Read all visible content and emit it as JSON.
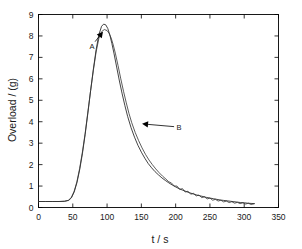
{
  "chart_data": {
    "type": "line",
    "title": "",
    "xlabel": "t / s",
    "ylabel": "Overload / (g)",
    "xlim": [
      0,
      350
    ],
    "ylim": [
      0,
      9
    ],
    "xticks": [
      0,
      50,
      100,
      150,
      200,
      250,
      300,
      350
    ],
    "yticks": [
      0,
      1,
      2,
      3,
      4,
      5,
      6,
      7,
      8,
      9
    ],
    "grid": false,
    "legend": "none",
    "annotations": [
      {
        "text": "A",
        "label_x": 78,
        "label_y": 7.55,
        "arrow_to_x": 94,
        "arrow_to_y": 8.2
      },
      {
        "text": "B",
        "label_x": 205,
        "label_y": 3.75,
        "arrow_to_x": 151,
        "arrow_to_y": 3.9
      }
    ],
    "series": [
      {
        "name": "A",
        "color": "#222222",
        "x": [
          0,
          10,
          20,
          30,
          38,
          44,
          48,
          52,
          56,
          60,
          64,
          68,
          72,
          76,
          80,
          84,
          88,
          92,
          95,
          98,
          101,
          104,
          107,
          110,
          114,
          118,
          122,
          126,
          130,
          135,
          140,
          145,
          150,
          155,
          160,
          165,
          170,
          175,
          180,
          185,
          190,
          195,
          200,
          205,
          210,
          215,
          220,
          225,
          230,
          235,
          240,
          245,
          250,
          255,
          260,
          265,
          270,
          275,
          280,
          285,
          290,
          295,
          300,
          305,
          310,
          315
        ],
        "y": [
          0.28,
          0.28,
          0.28,
          0.28,
          0.29,
          0.33,
          0.45,
          0.72,
          1.15,
          1.75,
          2.5,
          3.4,
          4.4,
          5.45,
          6.45,
          7.35,
          8.05,
          8.45,
          8.55,
          8.52,
          8.35,
          8.05,
          7.65,
          7.2,
          6.55,
          5.9,
          5.3,
          4.75,
          4.25,
          3.72,
          3.28,
          2.9,
          2.58,
          2.3,
          2.05,
          1.85,
          1.67,
          1.52,
          1.38,
          1.26,
          1.15,
          1.05,
          0.96,
          0.88,
          0.81,
          0.75,
          0.69,
          0.64,
          0.59,
          0.55,
          0.51,
          0.47,
          0.44,
          0.41,
          0.38,
          0.35,
          0.33,
          0.31,
          0.29,
          0.27,
          0.25,
          0.23,
          0.22,
          0.2,
          0.19,
          0.18
        ]
      },
      {
        "name": "B",
        "color": "#333333",
        "x": [
          0,
          10,
          20,
          30,
          38,
          44,
          48,
          52,
          56,
          60,
          64,
          68,
          72,
          76,
          80,
          84,
          88,
          92,
          96,
          100,
          103,
          106,
          109,
          112,
          116,
          120,
          124,
          128,
          132,
          136,
          141,
          146,
          151,
          156,
          161,
          166,
          171,
          176,
          181,
          186,
          190,
          194,
          198,
          202,
          206,
          210,
          214,
          218,
          222,
          226,
          230,
          234,
          238,
          242,
          246,
          250,
          254,
          258,
          262,
          266,
          270,
          274,
          278,
          282,
          286,
          290,
          294,
          298,
          302,
          306,
          310,
          314
        ],
        "y": [
          0.28,
          0.28,
          0.28,
          0.28,
          0.29,
          0.34,
          0.48,
          0.76,
          1.2,
          1.82,
          2.58,
          3.45,
          4.45,
          5.45,
          6.4,
          7.25,
          7.88,
          8.2,
          8.3,
          8.25,
          8.12,
          7.9,
          7.58,
          7.2,
          6.62,
          6.0,
          5.42,
          4.88,
          4.38,
          3.95,
          3.5,
          3.12,
          2.78,
          2.48,
          2.22,
          2.0,
          1.8,
          1.62,
          1.46,
          1.32,
          1.2,
          1.14,
          1.0,
          1.0,
          0.84,
          0.88,
          0.72,
          0.76,
          0.62,
          0.66,
          0.54,
          0.58,
          0.46,
          0.5,
          0.4,
          0.44,
          0.34,
          0.38,
          0.3,
          0.34,
          0.26,
          0.3,
          0.23,
          0.27,
          0.2,
          0.24,
          0.18,
          0.22,
          0.16,
          0.2,
          0.14,
          0.17
        ]
      }
    ]
  }
}
